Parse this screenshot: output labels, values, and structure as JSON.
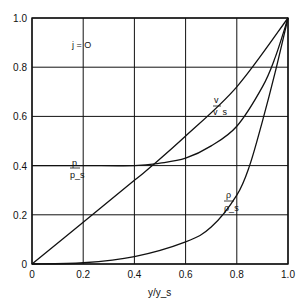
{
  "chart_data": {
    "type": "line",
    "title": "",
    "xlabel": "y/y_s",
    "ylabel": "",
    "xlim": [
      0,
      1.0
    ],
    "ylim": [
      0,
      1.0
    ],
    "grid": true,
    "x_ticks": [
      "0",
      "0.2",
      "0.4",
      "0.6",
      "0.8",
      "1.0"
    ],
    "y_ticks": [
      "0",
      "0.2",
      "0.4",
      "0.6",
      "0.8",
      "1.0"
    ],
    "annotation": "j = O",
    "series": [
      {
        "name": "v/v_s",
        "label_num": "v",
        "label_den": "v_s",
        "x": [
          0,
          0.2,
          0.4,
          0.47,
          0.6,
          0.8,
          1.0
        ],
        "y": [
          0,
          0.17,
          0.34,
          0.4,
          0.52,
          0.72,
          1.0
        ]
      },
      {
        "name": "p/p_s",
        "label_num": "p",
        "label_den": "p_s",
        "x": [
          0,
          0.2,
          0.4,
          0.5,
          0.6,
          0.7,
          0.8,
          0.9,
          0.95,
          1.0
        ],
        "y": [
          0.4,
          0.4,
          0.4,
          0.41,
          0.43,
          0.48,
          0.56,
          0.72,
          0.84,
          1.0
        ]
      },
      {
        "name": "rho/rho_s",
        "label_num": "ρ",
        "label_den": "ρ_s",
        "x": [
          0,
          0.2,
          0.4,
          0.6,
          0.7,
          0.8,
          0.85,
          0.9,
          0.95,
          1.0
        ],
        "y": [
          0,
          0.005,
          0.03,
          0.09,
          0.15,
          0.28,
          0.4,
          0.58,
          0.78,
          1.0
        ]
      }
    ]
  }
}
